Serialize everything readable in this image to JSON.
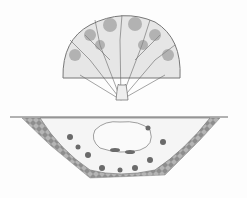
{
  "illustration": {
    "subject": "tree with root ball planted in soil pit",
    "style": "pen-and-ink line drawing",
    "colors": {
      "background": "#fdfdfd",
      "ink": "#555555",
      "soil": "#9a9a9a",
      "stones": "#6a6a6a"
    }
  }
}
